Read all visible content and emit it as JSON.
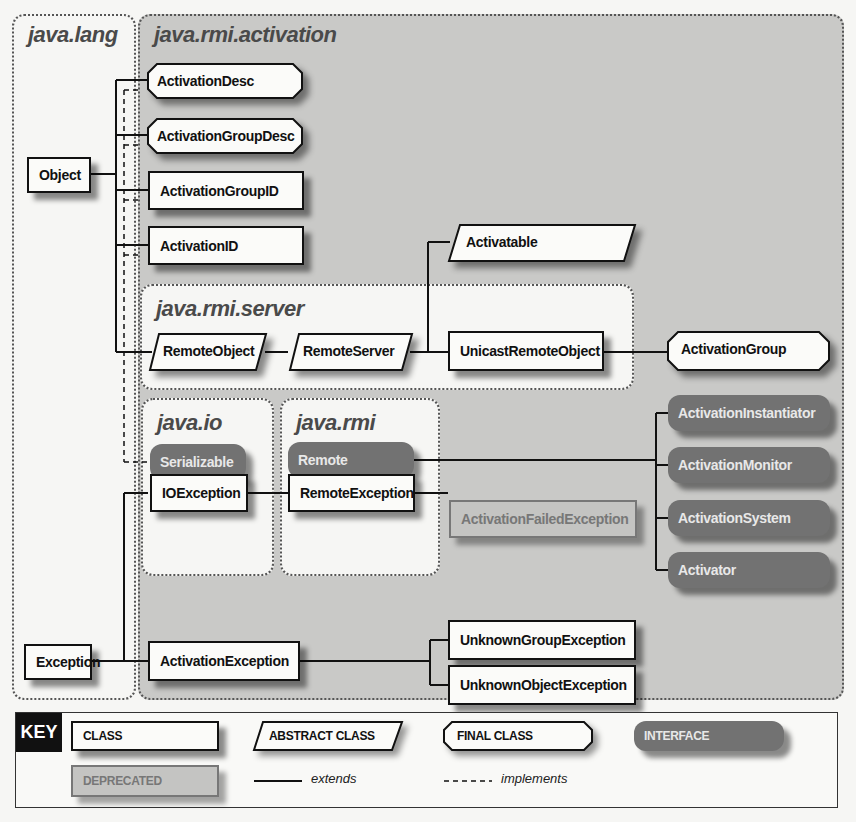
{
  "packages": {
    "java_lang": "java.lang",
    "java_rmi_activation": "java.rmi.activation",
    "java_rmi_server": "java.rmi.server",
    "java_io": "java.io",
    "java_rmi": "java.rmi"
  },
  "nodes": {
    "object": "Object",
    "exception": "Exception",
    "activation_desc": "ActivationDesc",
    "activation_group_desc": "ActivationGroupDesc",
    "activation_group_id": "ActivationGroupID",
    "activation_id": "ActivationID",
    "activatable": "Activatable",
    "remote_object": "RemoteObject",
    "remote_server": "RemoteServer",
    "unicast_remote_object": "UnicastRemoteObject",
    "activation_group": "ActivationGroup",
    "serializable": "Serializable",
    "remote": "Remote",
    "io_exception": "IOException",
    "remote_exception": "RemoteException",
    "activation_failed_exception": "ActivationFailedException",
    "activation_instantiator": "ActivationInstantiator",
    "activation_monitor": "ActivationMonitor",
    "activation_system": "ActivationSystem",
    "activator": "Activator",
    "activation_exception": "ActivationException",
    "unknown_group_exception": "UnknownGroupException",
    "unknown_object_exception": "UnknownObjectException"
  },
  "key": {
    "badge": "KEY",
    "class": "CLASS",
    "abstract_class": "ABSTRACT CLASS",
    "final_class": "FINAL CLASS",
    "interface": "INTERFACE",
    "deprecated": "DEPRECATED",
    "extends": "extends",
    "implements": "implements"
  },
  "colors": {
    "shaded_package": "#c9c9c7",
    "interface_fill": "#727272",
    "class_fill": "#fbfbf9",
    "deprecated_text": "#777777"
  }
}
